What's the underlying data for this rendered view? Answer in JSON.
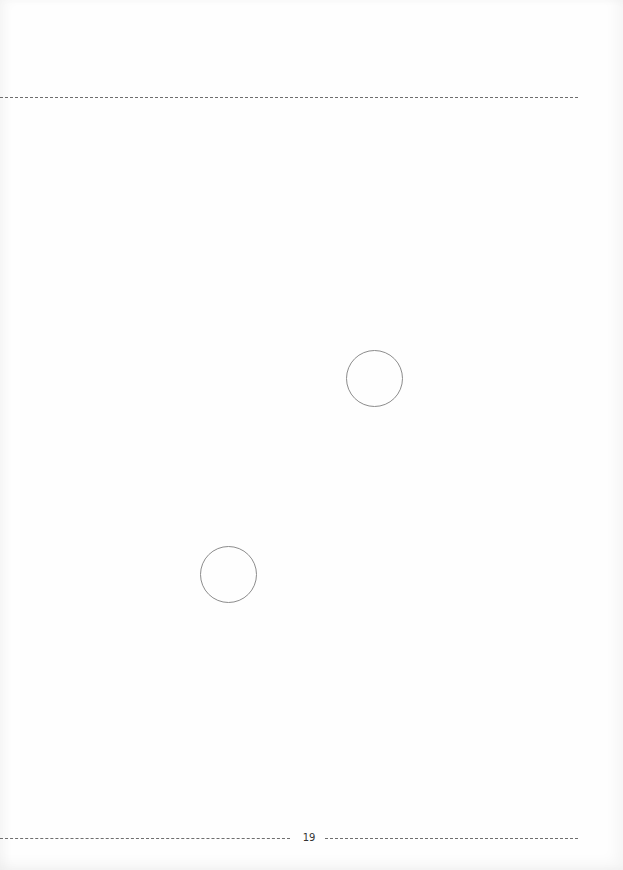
{
  "page": {
    "page_number": "19",
    "background_color": "#fefefe",
    "rule_color": "#6e6e6e"
  },
  "shapes": [
    {
      "type": "circle",
      "cx": 374,
      "cy": 378,
      "r": 28,
      "stroke": "#8c8c8c"
    },
    {
      "type": "circle",
      "cx": 228,
      "cy": 574,
      "r": 28,
      "stroke": "#8c8c8c"
    }
  ]
}
